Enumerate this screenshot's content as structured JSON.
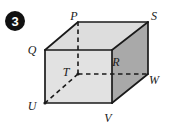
{
  "figure": {
    "badge": {
      "label": "3",
      "circle_color": "#111111",
      "text_color": "#ffffff",
      "cx": 15,
      "cy": 21,
      "r": 10
    },
    "shape_name": "rectangular-prism",
    "colors": {
      "front_face": "#e2e2e2",
      "top_face": "#dddddd",
      "right_face": "#a9a9a9",
      "edge": "#1a1a1a",
      "hidden_edge": "#1a1a1a",
      "background": "#ffffff",
      "label_text": "#1a1a1a"
    },
    "vertices": [
      {
        "name": "P",
        "x": 78,
        "y": 22,
        "label_x": 74,
        "label_y": 16,
        "hidden": false
      },
      {
        "name": "S",
        "x": 148,
        "y": 22,
        "label_x": 154,
        "label_y": 16,
        "hidden": false
      },
      {
        "name": "Q",
        "x": 45,
        "y": 50,
        "label_x": 32,
        "label_y": 50,
        "hidden": false
      },
      {
        "name": "R",
        "x": 112,
        "y": 50,
        "label_x": 116,
        "label_y": 62,
        "hidden": false
      },
      {
        "name": "T",
        "x": 78,
        "y": 74,
        "label_x": 66,
        "label_y": 72,
        "hidden": true
      },
      {
        "name": "W",
        "x": 148,
        "y": 74,
        "label_x": 154,
        "label_y": 80,
        "hidden": false
      },
      {
        "name": "U",
        "x": 45,
        "y": 103,
        "label_x": 32,
        "label_y": 106,
        "hidden": false
      },
      {
        "name": "V",
        "x": 112,
        "y": 103,
        "label_x": 108,
        "label_y": 118,
        "hidden": false
      }
    ],
    "solid_edges": [
      {
        "from": "Q",
        "to": "P"
      },
      {
        "from": "P",
        "to": "S"
      },
      {
        "from": "Q",
        "to": "R"
      },
      {
        "from": "R",
        "to": "S"
      },
      {
        "from": "Q",
        "to": "U"
      },
      {
        "from": "R",
        "to": "V"
      },
      {
        "from": "S",
        "to": "W"
      },
      {
        "from": "U",
        "to": "V"
      },
      {
        "from": "V",
        "to": "W"
      }
    ],
    "hidden_edges": [
      {
        "from": "T",
        "to": "P"
      },
      {
        "from": "T",
        "to": "W"
      },
      {
        "from": "T",
        "to": "U"
      }
    ],
    "faces": [
      {
        "name": "front-face",
        "vertices": [
          "Q",
          "R",
          "V",
          "U"
        ],
        "fill": "#e2e2e2"
      },
      {
        "name": "top-face",
        "vertices": [
          "Q",
          "P",
          "S",
          "R"
        ],
        "fill": "#dddddd"
      },
      {
        "name": "right-face",
        "vertices": [
          "R",
          "S",
          "W",
          "V"
        ],
        "fill": "#a9a9a9"
      }
    ]
  }
}
